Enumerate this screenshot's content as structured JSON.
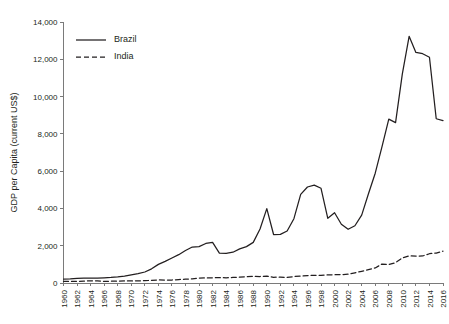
{
  "chart_data": {
    "type": "line",
    "title": "",
    "xlabel": "",
    "ylabel": "GDP per Capita (current US$)",
    "grid": false,
    "legend_position": "top-left",
    "xlim": [
      1960,
      2016
    ],
    "ylim": [
      0,
      14000
    ],
    "x": [
      1960,
      1961,
      1962,
      1963,
      1964,
      1965,
      1966,
      1967,
      1968,
      1969,
      1970,
      1971,
      1972,
      1973,
      1974,
      1975,
      1976,
      1977,
      1978,
      1979,
      1980,
      1981,
      1982,
      1983,
      1984,
      1985,
      1986,
      1987,
      1988,
      1989,
      1990,
      1991,
      1992,
      1993,
      1994,
      1995,
      1996,
      1997,
      1998,
      1999,
      2000,
      2001,
      2002,
      2003,
      2004,
      2005,
      2006,
      2007,
      2008,
      2009,
      2010,
      2011,
      2012,
      2013,
      2014,
      2015,
      2016
    ],
    "xtick_labels": [
      "1960",
      "1962",
      "1964",
      "1966",
      "1968",
      "1970",
      "1972",
      "1974",
      "1976",
      "1978",
      "1980",
      "1982",
      "1984",
      "1986",
      "1988",
      "1990",
      "1992",
      "1994",
      "1996",
      "1998",
      "2000",
      "2002",
      "2004",
      "2006",
      "2008",
      "2010",
      "2012",
      "2014",
      "2016"
    ],
    "ytick_labels": [
      "0",
      "2,000",
      "4,000",
      "6,000",
      "8,000",
      "10,000",
      "12,000",
      "14,000"
    ],
    "ytick_values": [
      0,
      2000,
      4000,
      6000,
      8000,
      10000,
      12000,
      14000
    ],
    "series": [
      {
        "name": "Brazil",
        "style": "solid",
        "color": "#231f20",
        "values": [
          210,
          215,
          250,
          265,
          260,
          265,
          280,
          300,
          330,
          370,
          440,
          500,
          590,
          760,
          1000,
          1160,
          1340,
          1520,
          1740,
          1930,
          1950,
          2120,
          2180,
          1600,
          1590,
          1650,
          1830,
          1950,
          2180,
          2900,
          3990,
          2600,
          2610,
          2790,
          3450,
          4750,
          5150,
          5250,
          5080,
          3470,
          3770,
          3150,
          2880,
          3070,
          3640,
          4790,
          5890,
          7320,
          8790,
          8600,
          11220,
          13230,
          12370,
          12300,
          12110,
          8810,
          8710
        ]
      },
      {
        "name": "India",
        "style": "dashed",
        "color": "#231f20",
        "values": [
          82,
          85,
          89,
          100,
          115,
          119,
          90,
          96,
          100,
          108,
          112,
          119,
          122,
          145,
          163,
          159,
          161,
          186,
          205,
          225,
          267,
          273,
          275,
          291,
          278,
          296,
          310,
          338,
          355,
          348,
          368,
          304,
          317,
          301,
          346,
          374,
          400,
          415,
          413,
          441,
          443,
          451,
          470,
          547,
          627,
          715,
          807,
          1018,
          991,
          1090,
          1345,
          1458,
          1444,
          1450,
          1570,
          1606,
          1710
        ]
      }
    ]
  },
  "legend": {
    "items": [
      {
        "label": "Brazil",
        "style": "solid"
      },
      {
        "label": "India",
        "style": "dashed"
      }
    ]
  }
}
